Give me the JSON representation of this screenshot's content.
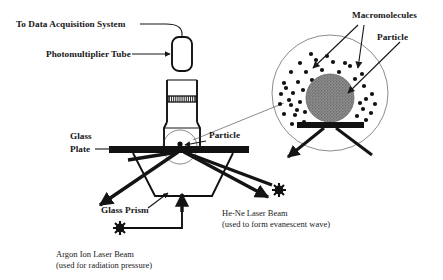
{
  "figure": {
    "background_color": "#ffffff",
    "ink_color": "#111111"
  },
  "labels": {
    "data_acquisition": "To Data Acquisition System",
    "photomultiplier_tube": "Photomultiplier Tube",
    "glass_plate_line1": "Glass",
    "glass_plate_line2": "Plate",
    "particle_main": "Particle",
    "glass_prism": "Glass Prism",
    "argon_line1": "Argon Ion Laser Beam",
    "argon_line2": "(used for radiation pressure)",
    "hene_line1": "He-Ne Laser Beam",
    "hene_line2": "(used to form evanescent wave)",
    "macromolecules": "Macromolecules",
    "particle_inset": "Particle"
  },
  "inset": {
    "circle_center_x": 330,
    "circle_center_y": 93,
    "circle_radius": 58,
    "particle_center_x": 330,
    "particle_center_y": 98,
    "particle_radius": 24,
    "particle_fill": "#8e8e8e",
    "substrate_bar": {
      "x": 297,
      "y": 122,
      "width": 67,
      "height": 6
    },
    "macromolecule_dots": [
      [
        300,
        63
      ],
      [
        316,
        60
      ],
      [
        333,
        62
      ],
      [
        350,
        66
      ],
      [
        362,
        74
      ],
      [
        291,
        72
      ],
      [
        306,
        72
      ],
      [
        322,
        70
      ],
      [
        339,
        72
      ],
      [
        355,
        79
      ],
      [
        284,
        83
      ],
      [
        298,
        82
      ],
      [
        312,
        80
      ],
      [
        364,
        86
      ],
      [
        372,
        94
      ],
      [
        281,
        94
      ],
      [
        293,
        93
      ],
      [
        303,
        90
      ],
      [
        366,
        99
      ],
      [
        375,
        104
      ],
      [
        280,
        104
      ],
      [
        291,
        105
      ],
      [
        300,
        102
      ],
      [
        363,
        109
      ],
      [
        371,
        113
      ],
      [
        284,
        114
      ],
      [
        295,
        115
      ],
      [
        305,
        112
      ],
      [
        357,
        116
      ],
      [
        366,
        120
      ],
      [
        292,
        124
      ],
      [
        304,
        122
      ],
      [
        352,
        124
      ],
      [
        289,
        100
      ],
      [
        286,
        88
      ],
      [
        345,
        63
      ],
      [
        327,
        56
      ],
      [
        311,
        54
      ],
      [
        360,
        103
      ],
      [
        297,
        110
      ]
    ]
  },
  "geometry": {
    "pmt_tube": {
      "x": 172,
      "y": 37,
      "width": 20,
      "height": 34,
      "radius": 7
    },
    "microscope_barrel": {
      "x": 167,
      "y": 80,
      "width": 30,
      "height": 42
    },
    "filter_band": {
      "x": 168,
      "y": 96,
      "width": 28,
      "height": 6
    },
    "glass_plate_bar": {
      "x": 109,
      "y": 146,
      "width": 140,
      "height": 7
    },
    "particle_dot": {
      "cx": 180,
      "cy": 144,
      "r": 2.6
    },
    "magnify_circle": {
      "cx": 180,
      "cy": 147,
      "r": 17
    }
  },
  "icons": {
    "laser_source": "starburst-icon",
    "arrow": "arrowhead-icon"
  }
}
